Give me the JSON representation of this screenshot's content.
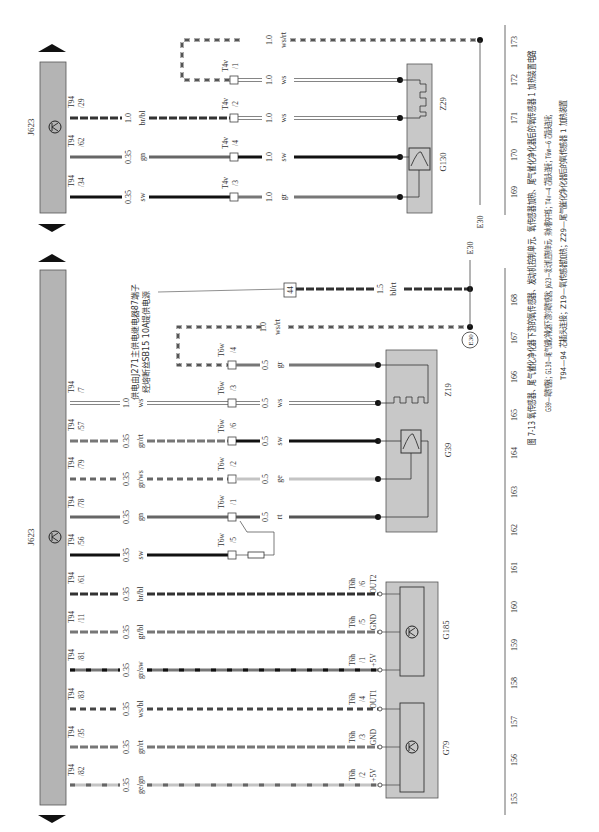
{
  "figure": {
    "caption_title": "图 7-13  氧传感器、尾气催化净化器下游的氧传感器、发动机控制单元、氧传感器加热、尾气催化净化器后的氧传感器 1 加热装置电路",
    "caption_line2": "G39—氧传感器；G130—尾气催化净化器下游的氧传感器；J623—发动机控制单元，排水槽内中部；T4v—4 芯插头连接；T6w—6 芯插头连接；",
    "caption_line3": "T94—94 芯插头连接；Z19—氧传感器加热；Z29—尾气催化净化器后的氧传感器 1 加热装置",
    "page_numbers": [
      "155",
      "156",
      "157",
      "158",
      "159",
      "160",
      "161",
      "162",
      "163",
      "164",
      "165",
      "166",
      "167",
      "168",
      "169",
      "170",
      "171",
      "172",
      "173"
    ]
  },
  "ecu": {
    "label_top": "J623",
    "label_bottom": "J623",
    "icon": "transistor-icon"
  },
  "top_section": {
    "wires": [
      {
        "pin": "T94/29",
        "pin_a": "T94",
        "pin_b": "/29",
        "size": "1.0",
        "color": "br/bl",
        "conn_a": "T4v",
        "conn_b": "/2",
        "size2": "1.0",
        "color2": "ws"
      },
      {
        "pin": "T94/62",
        "pin_a": "T94",
        "pin_b": "/62",
        "size": "0.35",
        "color": "gn",
        "conn_a": "T4v",
        "conn_b": "/4",
        "size2": "1.0",
        "color2": "sw"
      },
      {
        "pin": "T94/34",
        "pin_a": "T94",
        "pin_b": "/34",
        "size": "0.35",
        "color": "sw",
        "conn_a": "T4v",
        "conn_b": "/3",
        "size2": "1.0",
        "color2": "gr"
      }
    ],
    "loop": {
      "conn_a": "T4v",
      "conn_b": "/1",
      "size": "1.0",
      "color": "ws",
      "size_top": "1.0",
      "color_top": "ws/rt"
    },
    "component_heater": "Z29",
    "component_sensor": "G130",
    "ground_label": "E30"
  },
  "middle_section": {
    "supply_note_1": "供电由J271主供电继电器87端子",
    "supply_note_2": "经熔断丝SB15 10A提供电源",
    "fuse_box": "44",
    "supply_wire": {
      "size": "1.5",
      "color": "bl/rt"
    },
    "loop": {
      "conn_a": "T6w",
      "conn_b": "/4",
      "size": "1.0",
      "color": "ws/rt",
      "size2": "0.5",
      "color2": "gr"
    },
    "e30_top": "E30",
    "e30_circle": "E30",
    "wires": [
      {
        "pin_a": "T94",
        "pin_b": "/7",
        "size": "1.0",
        "color": "ws",
        "conn_a": "T6w",
        "conn_b": "/3",
        "size2": "0.5",
        "color2": "ws"
      },
      {
        "pin_a": "T94",
        "pin_b": "/57",
        "size": "0.35",
        "color": "gr/rt",
        "conn_a": "T6w",
        "conn_b": "/6",
        "size2": "0.5",
        "color2": "sw"
      },
      {
        "pin_a": "T94",
        "pin_b": "/79",
        "size": "0.35",
        "color": "gr/ws",
        "conn_a": "T6w",
        "conn_b": "/2",
        "size2": "0.5",
        "color2": "ge"
      },
      {
        "pin_a": "T94",
        "pin_b": "/78",
        "size": "0.35",
        "color": "gn",
        "conn_a": "T6w",
        "conn_b": "/1",
        "size2": "0.5",
        "color2": "rt"
      },
      {
        "pin_a": "T94",
        "pin_b": "/56",
        "size": "0.35",
        "color": "sw",
        "conn_a": "T6w",
        "conn_b": "/5"
      }
    ],
    "component_heater": "Z19",
    "component_sensor": "G39"
  },
  "pedal_section": {
    "wires": [
      {
        "pin_a": "T94",
        "pin_b": "/61",
        "size": "0.35",
        "color": "br/bl",
        "conn_a": "T6h",
        "conn_b": "/6",
        "sig": "OUT2"
      },
      {
        "pin_a": "T94",
        "pin_b": "/11",
        "size": "0.35",
        "color": "gr/bl",
        "conn_a": "T6h",
        "conn_b": "/5",
        "sig": "GND"
      },
      {
        "pin_a": "T94",
        "pin_b": "/81",
        "size": "0.35",
        "color": "gr/sw",
        "conn_a": "T6h",
        "conn_b": "/1",
        "sig": "+5V"
      },
      {
        "pin_a": "T94",
        "pin_b": "/83",
        "size": "0.35",
        "color": "ws/bl",
        "conn_a": "T6h",
        "conn_b": "/4",
        "sig": "OUT1"
      },
      {
        "pin_a": "T94",
        "pin_b": "/35",
        "size": "0.35",
        "color": "gr/rt",
        "conn_a": "T6h",
        "conn_b": "/3",
        "sig": "GND"
      },
      {
        "pin_a": "T94",
        "pin_b": "/82",
        "size": "0.35",
        "color": "ge/gn",
        "conn_a": "T6h",
        "conn_b": "/2",
        "sig": "+5V"
      }
    ],
    "component_upper": "G185",
    "component_lower": "G79"
  },
  "colors": {
    "ecu_fill": "#b4b4b4",
    "component_fill": "#c8c8c8",
    "wire_black": "#111111",
    "wire_grey": "#777777",
    "wire_green": "#666666",
    "wire_yellow": "#c4c4c4",
    "wire_brown": "#333333"
  }
}
